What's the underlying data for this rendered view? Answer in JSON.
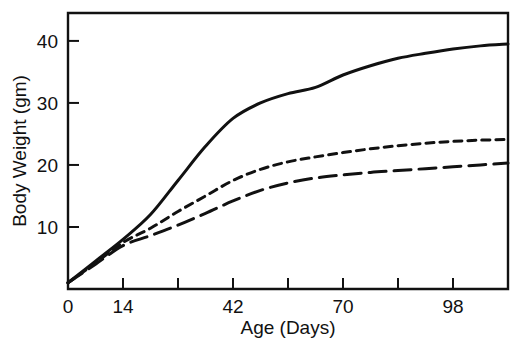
{
  "chart_data": {
    "type": "line",
    "title": "",
    "xlabel": "Age (Days)",
    "ylabel": "Body Weight (gm)",
    "xlim": [
      0,
      112
    ],
    "ylim": [
      0,
      44.5
    ],
    "grid": false,
    "legend": "none",
    "xticks": [
      0,
      14,
      28,
      42,
      56,
      70,
      84,
      98,
      112
    ],
    "xtick_labels": [
      "0",
      "14",
      "",
      "42",
      "",
      "70",
      "",
      "98",
      ""
    ],
    "xtick_labels_visible": [
      "0",
      "14",
      "42",
      "70",
      "98"
    ],
    "yticks": [
      10,
      20,
      30,
      40
    ],
    "ytick_labels": [
      "10",
      "20",
      "30",
      "40"
    ],
    "x": [
      0,
      7,
      14,
      21,
      28,
      35,
      42,
      49,
      56,
      63,
      70,
      77,
      84,
      91,
      98,
      105,
      112
    ],
    "series": [
      {
        "name": "solid-curve",
        "style": "solid",
        "values": [
          1.0,
          4.5,
          8.0,
          12.0,
          17.5,
          23.0,
          27.5,
          30.0,
          31.5,
          32.5,
          34.5,
          36.0,
          37.2,
          38.0,
          38.7,
          39.2,
          39.5
        ]
      },
      {
        "name": "short-dashed-curve",
        "style": "short-dash",
        "values": [
          1.0,
          4.2,
          7.5,
          9.8,
          12.5,
          15.0,
          17.5,
          19.3,
          20.5,
          21.3,
          22.0,
          22.6,
          23.1,
          23.5,
          23.8,
          24.0,
          24.1
        ]
      },
      {
        "name": "long-dashed-curve",
        "style": "long-dash",
        "values": [
          1.0,
          4.0,
          7.0,
          8.6,
          10.3,
          12.2,
          14.2,
          15.9,
          17.1,
          17.9,
          18.4,
          18.8,
          19.1,
          19.4,
          19.7,
          20.0,
          20.3
        ]
      }
    ]
  },
  "axis": {
    "x_title": "Age (Days)",
    "y_title": "Body Weight (gm)"
  },
  "colors": {
    "ink": "#111111",
    "background": "#ffffff"
  }
}
